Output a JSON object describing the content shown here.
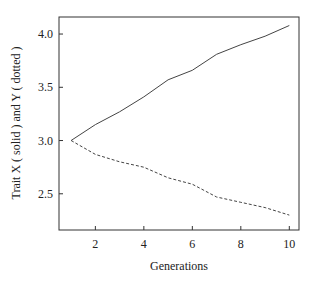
{
  "chart_data": {
    "type": "line",
    "title": "",
    "xlabel": "Generations",
    "ylabel": "Trait X ( solid ) and Y ( dotted )",
    "x": [
      1,
      2,
      3,
      4,
      5,
      6,
      7,
      8,
      9,
      10
    ],
    "series": [
      {
        "name": "Trait X (solid)",
        "style": "solid",
        "values": [
          3.0,
          3.15,
          3.27,
          3.41,
          3.57,
          3.66,
          3.81,
          3.9,
          3.98,
          4.08
        ]
      },
      {
        "name": "Trait Y (dotted)",
        "style": "dotted",
        "values": [
          3.0,
          2.87,
          2.8,
          2.75,
          2.65,
          2.59,
          2.47,
          2.42,
          2.37,
          2.3
        ]
      }
    ],
    "xlim": [
      0.5,
      10.4
    ],
    "ylim": [
      2.16,
      4.16
    ],
    "xticks": [
      2,
      4,
      6,
      8,
      10
    ],
    "xtick_labels": [
      "2",
      "4",
      "6",
      "8",
      "10"
    ],
    "yticks": [
      2.5,
      3.0,
      3.5,
      4.0
    ],
    "ytick_labels": [
      "2.5",
      "3.0",
      "3.5",
      "4.0"
    ],
    "grid": false,
    "legend": "none"
  }
}
